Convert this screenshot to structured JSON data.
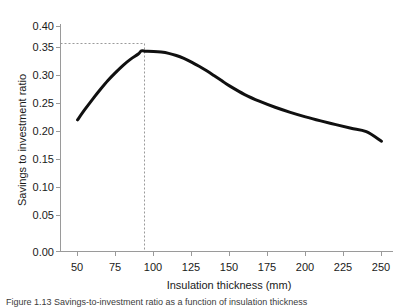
{
  "figure": {
    "background_color": "#ffffff",
    "caption": "Figure 1.13  Savings-to-investment ratio as a function of insulation thickness"
  },
  "chart_data": {
    "type": "line",
    "title": "",
    "subtitle": "",
    "xlabel": "Insulation thickness (mm)",
    "ylabel": "Savings to investment ratio",
    "xlim": [
      37.5,
      262.5
    ],
    "ylim": [
      0.0,
      0.4
    ],
    "xticks": [
      50,
      75,
      100,
      125,
      150,
      175,
      200,
      225,
      250
    ],
    "xtick_labels": [
      "50",
      "75",
      "100",
      "125",
      "150",
      "175",
      "200",
      "225",
      "250"
    ],
    "yticks": [
      0.0,
      0.05,
      0.1,
      0.15,
      0.2,
      0.25,
      0.3,
      0.35,
      0.4
    ],
    "ytick_labels": [
      "0.00",
      "0.05",
      "0.10",
      "0.15",
      "0.20",
      "0.25",
      "0.30",
      "0.35",
      "0.40"
    ],
    "grid": false,
    "legend": null,
    "line_color": "#101010",
    "line_width": 3,
    "series": [
      {
        "name": "Savings to investment ratio",
        "x": [
          50,
          55,
          60,
          65,
          70,
          75,
          80,
          85,
          90,
          92,
          95,
          100,
          105,
          110,
          115,
          120,
          125,
          130,
          135,
          140,
          145,
          150,
          160,
          170,
          180,
          190,
          200,
          210,
          220,
          230,
          240,
          250
        ],
        "y": [
          0.234,
          0.253,
          0.271,
          0.288,
          0.304,
          0.318,
          0.331,
          0.342,
          0.351,
          0.3565,
          0.3562,
          0.3557,
          0.3545,
          0.3522,
          0.3484,
          0.3432,
          0.3368,
          0.3294,
          0.3212,
          0.3124,
          0.3034,
          0.2944,
          0.279,
          0.2668,
          0.2564,
          0.2474,
          0.2394,
          0.2322,
          0.2255,
          0.219,
          0.213,
          0.196
        ]
      }
    ],
    "annotations": [
      {
        "name": "optimum-marker",
        "type": "dashed-crosshair",
        "x": 92,
        "y": 0.357,
        "color": "#9a9a9a",
        "dash": "2 2"
      }
    ]
  }
}
